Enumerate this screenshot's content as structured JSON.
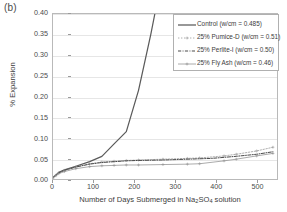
{
  "figure": {
    "panel_label": "(b)"
  },
  "chart_data": {
    "type": "line",
    "title": "",
    "xlabel": "Number of Days Submerged in Na2SO4 solution",
    "xlabel_parts": {
      "pre": "Number of Days Submerged in Na",
      "sub1": "2",
      "mid": "SO",
      "sub2": "4",
      "post": " solution"
    },
    "ylabel": "% Expansion",
    "xlim": [
      0,
      550
    ],
    "ylim": [
      0.0,
      0.4
    ],
    "xticks": [
      0,
      100,
      200,
      300,
      400,
      500
    ],
    "xtick_labels": [
      "0",
      "100",
      "200",
      "300",
      "400",
      "500"
    ],
    "yticks": [
      0.0,
      0.05,
      0.1,
      0.15,
      0.2,
      0.25,
      0.3,
      0.35,
      0.4
    ],
    "ytick_labels": [
      "0.00",
      "0.05",
      "0.10",
      "0.15",
      "0.20",
      "0.25",
      "0.30",
      "0.35",
      "0.40"
    ],
    "grid": true,
    "grid_axis": "y",
    "legend_position": "upper right",
    "series": [
      {
        "name": "Control (w/cm = 0.485)",
        "style": "solid",
        "color": "#5a5a5a",
        "marker": "none",
        "x": [
          0,
          7,
          14,
          28,
          56,
          90,
          120,
          150,
          180,
          210,
          240,
          250
        ],
        "y": [
          0.004,
          0.01,
          0.016,
          0.022,
          0.031,
          0.042,
          0.055,
          0.085,
          0.115,
          0.215,
          0.35,
          0.4
        ]
      },
      {
        "name": "25% Pumice-D (w/cm = 0.51)",
        "style": "dotted",
        "color": "#9a9a9a",
        "marker": "plus",
        "x": [
          0,
          7,
          14,
          28,
          56,
          90,
          120,
          150,
          180,
          210,
          270,
          330,
          360,
          420,
          450,
          500,
          540
        ],
        "y": [
          0.003,
          0.009,
          0.015,
          0.021,
          0.029,
          0.037,
          0.041,
          0.043,
          0.045,
          0.046,
          0.048,
          0.05,
          0.051,
          0.056,
          0.06,
          0.068,
          0.077
        ]
      },
      {
        "name": "25% Perlite-I (w/cm = 0.50)",
        "style": "dashdot",
        "color": "#3f3f3f",
        "marker": "none",
        "x": [
          0,
          7,
          14,
          28,
          56,
          90,
          120,
          150,
          180,
          210,
          270,
          330,
          390,
          450,
          500,
          540
        ],
        "y": [
          0.003,
          0.009,
          0.015,
          0.021,
          0.029,
          0.036,
          0.04,
          0.042,
          0.044,
          0.045,
          0.046,
          0.048,
          0.05,
          0.055,
          0.06,
          0.066
        ]
      },
      {
        "name": "25% Fly Ash (w/cm = 0.46)",
        "style": "solid-thin",
        "color": "#8e8e8e",
        "marker": "plus",
        "x": [
          0,
          7,
          14,
          28,
          56,
          90,
          120,
          150,
          180,
          210,
          270,
          330,
          360,
          420,
          450,
          500,
          540
        ],
        "y": [
          0.003,
          0.008,
          0.013,
          0.018,
          0.025,
          0.03,
          0.032,
          0.033,
          0.034,
          0.034,
          0.035,
          0.036,
          0.037,
          0.044,
          0.048,
          0.056,
          0.062
        ]
      }
    ]
  },
  "legend": {
    "items": [
      {
        "label": "Control (w/cm = 0.485)"
      },
      {
        "label": "25% Pumice-D (w/cm = 0.51)"
      },
      {
        "label": "25% Perlite-I (w/cm = 0.50)"
      },
      {
        "label": "25% Fly Ash (w/cm = 0.46)"
      }
    ]
  }
}
